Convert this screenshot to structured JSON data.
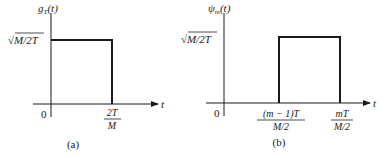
{
  "panel_a": {
    "y_label": "g",
    "y_label_sub": "T",
    "y_label_arg": "(t)",
    "amplitude_label": "√M/2T",
    "origin_label": "0",
    "x_axis_label": "t",
    "tick_num": "2T",
    "tick_den": "M",
    "caption": "(a)"
  },
  "panel_b": {
    "y_label": "ψ",
    "y_label_sub": "m",
    "y_label_arg": "(t)",
    "amplitude_label": "√M/2T",
    "origin_label": "0",
    "x_axis_label": "t",
    "tick1_num": "(m − 1)T",
    "tick1_den": "M/2",
    "tick2_num": "mT",
    "tick2_den": "M/2",
    "caption": "(b)"
  },
  "colors": {
    "line": "#1a1a1a",
    "text": "#222222",
    "background": "#ffffff"
  }
}
